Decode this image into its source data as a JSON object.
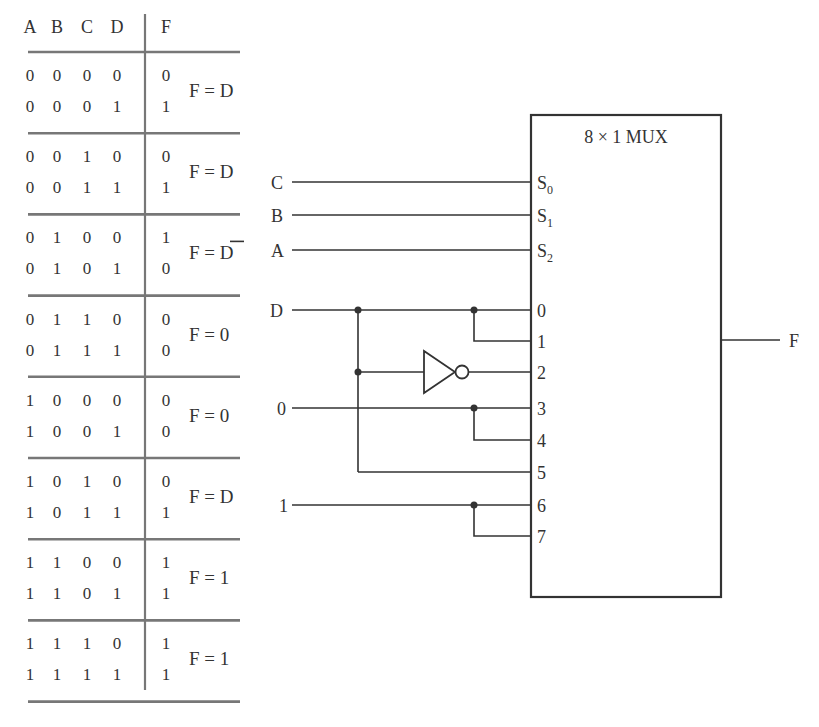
{
  "truth_table": {
    "headers": [
      "A",
      "B",
      "C",
      "D",
      "F"
    ],
    "groups": [
      {
        "rows": [
          [
            "0",
            "0",
            "0",
            "0",
            "0"
          ],
          [
            "0",
            "0",
            "0",
            "1",
            "1"
          ]
        ],
        "expression": "F = D",
        "overbar": false
      },
      {
        "rows": [
          [
            "0",
            "0",
            "1",
            "0",
            "0"
          ],
          [
            "0",
            "0",
            "1",
            "1",
            "1"
          ]
        ],
        "expression": "F = D",
        "overbar": false
      },
      {
        "rows": [
          [
            "0",
            "1",
            "0",
            "0",
            "1"
          ],
          [
            "0",
            "1",
            "0",
            "1",
            "0"
          ]
        ],
        "expression": "F = D",
        "overbar": true
      },
      {
        "rows": [
          [
            "0",
            "1",
            "1",
            "0",
            "0"
          ],
          [
            "0",
            "1",
            "1",
            "1",
            "0"
          ]
        ],
        "expression": "F = 0",
        "overbar": false
      },
      {
        "rows": [
          [
            "1",
            "0",
            "0",
            "0",
            "0"
          ],
          [
            "1",
            "0",
            "0",
            "1",
            "0"
          ]
        ],
        "expression": "F = 0",
        "overbar": false
      },
      {
        "rows": [
          [
            "1",
            "0",
            "1",
            "0",
            "0"
          ],
          [
            "1",
            "0",
            "1",
            "1",
            "1"
          ]
        ],
        "expression": "F = D",
        "overbar": false
      },
      {
        "rows": [
          [
            "1",
            "1",
            "0",
            "0",
            "1"
          ],
          [
            "1",
            "1",
            "0",
            "1",
            "1"
          ]
        ],
        "expression": "F = 1",
        "overbar": false
      },
      {
        "rows": [
          [
            "1",
            "1",
            "1",
            "0",
            "1"
          ],
          [
            "1",
            "1",
            "1",
            "1",
            "1"
          ]
        ],
        "expression": "F = 1",
        "overbar": false
      }
    ]
  },
  "mux": {
    "title": "8 × 1 MUX",
    "select_pins": [
      {
        "name": "S",
        "sub": "0",
        "input": "C"
      },
      {
        "name": "S",
        "sub": "1",
        "input": "B"
      },
      {
        "name": "S",
        "sub": "2",
        "input": "A"
      }
    ],
    "data_pins": [
      "0",
      "1",
      "2",
      "3",
      "4",
      "5",
      "6",
      "7"
    ],
    "source_labels": {
      "d": "D",
      "zero": "0",
      "one": "1"
    },
    "output_label": "F"
  },
  "colors": {
    "ink": "#333333",
    "rule": "#777777",
    "background": "#ffffff"
  }
}
